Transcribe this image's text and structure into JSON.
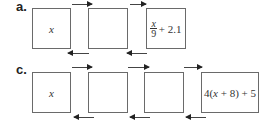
{
  "diagram": {
    "part_a": {
      "label": "a.",
      "boxes": [
        {
          "content": "x"
        },
        {
          "content": ""
        },
        {
          "content": "x/9 + 2.1",
          "numerator": "x",
          "denominator": "9",
          "rest": "+ 2.1"
        }
      ],
      "forward_arrows": 2,
      "backward_arrows": 2
    },
    "part_c": {
      "label": "c.",
      "boxes": [
        {
          "content": "x"
        },
        {
          "content": ""
        },
        {
          "content": ""
        },
        {
          "content": "4(x + 8) + 5",
          "prefix": "4(",
          "var": "x",
          "suffix": " + 8) + 5"
        }
      ],
      "forward_arrows": 3,
      "backward_arrows": 3
    }
  }
}
